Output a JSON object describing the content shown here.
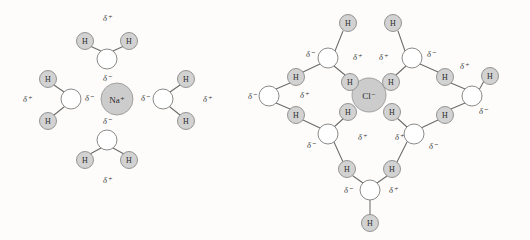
{
  "figure": {
    "background_color": "#fdfcfa",
    "bond_color": "#6b6b6b",
    "hydrogen_fill": "#d2d2d2",
    "oxygen_fill": "#ffffff",
    "ion_fill": "#cccccc",
    "labels": {
      "hydrogen": "H",
      "delta_positive": "δ⁺",
      "delta_negative": "δ⁻",
      "sodium_ion": "Na⁺",
      "chloride_ion": "Cl⁻"
    }
  },
  "panels": [
    {
      "id": "sodium-panel",
      "name": "sodium-hydration-shell",
      "ion": {
        "name": "sodium-ion",
        "label": "Na⁺",
        "cx": 117,
        "cy": 99,
        "r": 16
      },
      "water_molecules": [
        {
          "name": "water-top",
          "oxygen": {
            "cx": 107,
            "cy": 59,
            "r": 10
          },
          "hydrogens": [
            {
              "cx": 85,
              "cy": 41,
              "r": 8.5
            },
            {
              "cx": 129,
              "cy": 41,
              "r": 8.5
            }
          ],
          "delta_plus": {
            "text": "δ⁺",
            "x": 107,
            "y": 18
          },
          "delta_minus": {
            "text": "δ⁻",
            "x": 107,
            "y": 78
          }
        },
        {
          "name": "water-left",
          "oxygen": {
            "cx": 71,
            "cy": 99,
            "r": 10
          },
          "hydrogens": [
            {
              "cx": 48,
              "cy": 79,
              "r": 8.5
            },
            {
              "cx": 48,
              "cy": 121,
              "r": 8.5
            }
          ],
          "delta_plus": {
            "text": "δ⁺",
            "x": 27,
            "y": 99
          },
          "delta_minus": {
            "text": "δ⁻",
            "x": 89,
            "y": 98
          }
        },
        {
          "name": "water-right",
          "oxygen": {
            "cx": 163,
            "cy": 99,
            "r": 10
          },
          "hydrogens": [
            {
              "cx": 186,
              "cy": 79,
              "r": 8.5
            },
            {
              "cx": 186,
              "cy": 121,
              "r": 8.5
            }
          ],
          "delta_plus": {
            "text": "δ⁺",
            "x": 207,
            "y": 99
          },
          "delta_minus": {
            "text": "δ⁻",
            "x": 145,
            "y": 98
          }
        },
        {
          "name": "water-bottom",
          "oxygen": {
            "cx": 107,
            "cy": 140,
            "r": 10
          },
          "hydrogens": [
            {
              "cx": 85,
              "cy": 160,
              "r": 8.5
            },
            {
              "cx": 129,
              "cy": 160,
              "r": 8.5
            }
          ],
          "delta_plus": {
            "text": "δ⁺",
            "x": 107,
            "y": 180
          },
          "delta_minus": {
            "text": "δ⁻",
            "x": 107,
            "y": 121
          }
        }
      ]
    },
    {
      "id": "chloride-panel",
      "name": "chloride-hydration-shell",
      "ion": {
        "name": "chloride-ion",
        "label": "Cl⁻",
        "cx": 369,
        "cy": 95,
        "r": 17
      },
      "water_molecules": [
        {
          "name": "water-upper-left",
          "oxygen": {
            "cx": 328,
            "cy": 58,
            "r": 10
          },
          "hydrogens": [
            {
              "cx": 348,
              "cy": 23,
              "r": 8.5
            },
            {
              "cx": 296,
              "cy": 77,
              "r": 8.5
            },
            {
              "cx": 350,
              "cy": 82,
              "r": 8.5
            }
          ],
          "delta_plus": {
            "text": "δ⁺",
            "x": 357,
            "y": 57
          },
          "delta_minus": {
            "text": "δ⁻",
            "x": 310,
            "y": 54
          }
        },
        {
          "name": "water-upper-right",
          "oxygen": {
            "cx": 412,
            "cy": 58,
            "r": 10
          },
          "hydrogens": [
            {
              "cx": 393,
              "cy": 23,
              "r": 8.5
            },
            {
              "cx": 391,
              "cy": 82,
              "r": 8.5
            },
            {
              "cx": 445,
              "cy": 77,
              "r": 8.5
            }
          ],
          "delta_plus": {
            "text": "δ⁺",
            "x": 383,
            "y": 57
          },
          "delta_minus": {
            "text": "δ⁻",
            "x": 431,
            "y": 54
          }
        },
        {
          "name": "water-far-left",
          "oxygen": {
            "cx": 269,
            "cy": 96,
            "r": 10
          },
          "hydrogens": [],
          "delta_plus": {
            "text": "δ⁺",
            "x": 304,
            "y": 95
          },
          "delta_minus": {
            "text": "δ⁻",
            "x": 252,
            "y": 96
          }
        },
        {
          "name": "water-far-right",
          "oxygen": {
            "cx": 472,
            "cy": 96,
            "r": 10
          },
          "hydrogens": [
            {
              "cx": 490,
              "cy": 76,
              "r": 8.5
            }
          ],
          "delta_plus": {
            "text": "δ⁺",
            "x": 464,
            "y": 66
          },
          "delta_minus": {
            "text": "δ⁻",
            "x": 483,
            "y": 111
          }
        },
        {
          "name": "water-lower-left",
          "oxygen": {
            "cx": 328,
            "cy": 134,
            "r": 10
          },
          "hydrogens": [
            {
              "cx": 296,
              "cy": 115,
              "r": 8.5
            },
            {
              "cx": 348,
              "cy": 112,
              "r": 8.5
            },
            {
              "cx": 347,
              "cy": 169,
              "r": 8.5
            }
          ],
          "delta_plus": {
            "text": "δ⁺",
            "x": 362,
            "y": 137
          },
          "delta_minus": {
            "text": "δ⁻",
            "x": 311,
            "y": 145
          }
        },
        {
          "name": "water-lower-right",
          "oxygen": {
            "cx": 414,
            "cy": 134,
            "r": 10
          },
          "hydrogens": [
            {
              "cx": 392,
              "cy": 112,
              "r": 8.5
            },
            {
              "cx": 445,
              "cy": 115,
              "r": 8.5
            },
            {
              "cx": 392,
              "cy": 169,
              "r": 8.5
            }
          ],
          "delta_plus": {
            "text": "δ⁺",
            "x": 399,
            "y": 137
          },
          "delta_minus": {
            "text": "δ⁻",
            "x": 433,
            "y": 146
          }
        },
        {
          "name": "water-bottom-center",
          "oxygen": {
            "cx": 370,
            "cy": 190,
            "r": 10
          },
          "hydrogens": [
            {
              "cx": 370,
              "cy": 223,
              "r": 8.5
            }
          ],
          "delta_plus": {
            "text": "δ⁺",
            "x": 393,
            "y": 190
          },
          "delta_minus": {
            "text": "δ⁻",
            "x": 348,
            "y": 190
          }
        }
      ]
    }
  ]
}
